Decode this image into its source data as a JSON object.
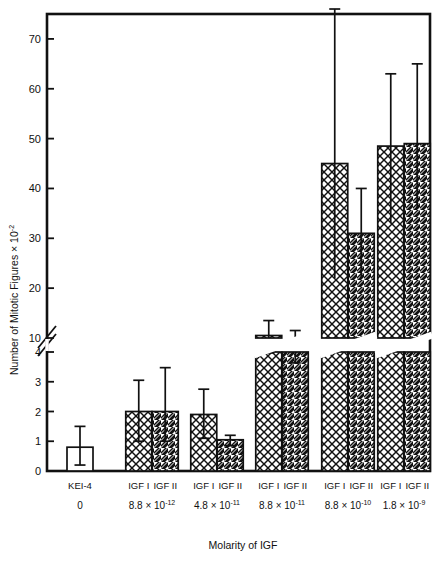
{
  "chart_data": {
    "type": "bar",
    "title": "",
    "xlabel": "Molarity of IGF",
    "ylabel": "Number of Mitotic Figures × 10",
    "ylabel_exponent": "-2",
    "grid": false,
    "legend": "none",
    "axis_break": {
      "present": true,
      "lower_range": [
        0,
        4
      ],
      "upper_range": [
        10,
        75
      ],
      "lower_ticks": [
        0,
        1,
        2,
        3,
        4
      ],
      "upper_ticks": [
        10,
        20,
        30,
        40,
        50,
        60,
        70
      ]
    },
    "ylim": [
      0,
      75
    ],
    "categories": [
      "KEI-4 / 0",
      "8.8 × 10⁻¹²",
      "4.8 × 10⁻¹¹",
      "8.8 × 10⁻¹¹",
      "8.8 × 10⁻¹⁰",
      "1.8 × 10⁻⁹"
    ],
    "groups": [
      {
        "molarity_mantissa": "0",
        "molarity_exponent": "",
        "molarity_full": "0",
        "bars": [
          {
            "label": "KEI-4",
            "pattern": "open",
            "value": 0.8,
            "err_low": 0.2,
            "err_high": 1.5
          }
        ]
      },
      {
        "molarity_mantissa": "8.8 × 10",
        "molarity_exponent": "-12",
        "molarity_full": "8.8 × 10⁻¹²",
        "bars": [
          {
            "label": "IGF I",
            "pattern": "crosshatch",
            "value": 2.0,
            "err_low": 1.0,
            "err_high": 3.05
          },
          {
            "label": "IGF II",
            "pattern": "diagonal",
            "value": 2.0,
            "err_low": 1.0,
            "err_high": 4.05
          }
        ]
      },
      {
        "molarity_mantissa": "4.8 × 10",
        "molarity_exponent": "-11",
        "molarity_full": "4.8 × 10⁻¹¹",
        "bars": [
          {
            "label": "IGF I",
            "pattern": "crosshatch",
            "value": 1.9,
            "err_low": 1.1,
            "err_high": 2.75
          },
          {
            "label": "IGF II",
            "pattern": "diagonal",
            "value": 1.05,
            "err_low": 0.85,
            "err_high": 1.2
          }
        ]
      },
      {
        "molarity_mantissa": "8.8 × 10",
        "molarity_exponent": "-11",
        "molarity_full": "8.8 × 10⁻¹¹",
        "bars": [
          {
            "label": "IGF I",
            "pattern": "crosshatch",
            "value": 10.5,
            "err_low": 7.0,
            "err_high": 13.5
          },
          {
            "label": "IGF II",
            "pattern": "diagonal",
            "value": 7.5,
            "err_low": 5.0,
            "err_high": 11.5
          }
        ]
      },
      {
        "molarity_mantissa": "8.8 × 10",
        "molarity_exponent": "-10",
        "molarity_full": "8.8 × 10⁻¹⁰",
        "bars": [
          {
            "label": "IGF I",
            "pattern": "crosshatch",
            "value": 45.0,
            "err_low": 22.0,
            "err_high": 76.0
          },
          {
            "label": "IGF II",
            "pattern": "diagonal",
            "value": 31.0,
            "err_low": 22.0,
            "err_high": 40.0
          }
        ]
      },
      {
        "molarity_mantissa": "1.8 × 10",
        "molarity_exponent": "-9",
        "molarity_full": "1.8 × 10⁻⁹",
        "bars": [
          {
            "label": "IGF I",
            "pattern": "crosshatch",
            "value": 48.5,
            "err_low": 33.0,
            "err_high": 63.0
          },
          {
            "label": "IGF II",
            "pattern": "diagonal",
            "value": 49.0,
            "err_low": 36.0,
            "err_high": 65.0
          }
        ]
      }
    ]
  },
  "style": {
    "ink": "#111111",
    "paper": "#ffffff"
  }
}
